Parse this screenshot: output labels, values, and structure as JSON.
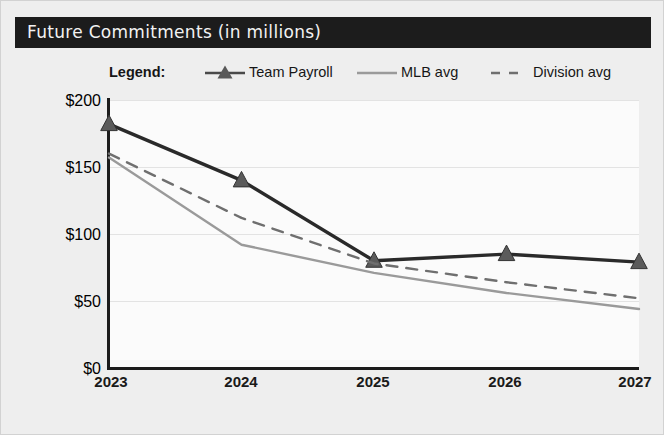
{
  "card": {
    "title": "Future Commitments (in millions)"
  },
  "legend": {
    "label": "Legend:",
    "entries": [
      {
        "name": "Team Payroll",
        "style": "line-marker",
        "color": "#2a2a2a"
      },
      {
        "name": "MLB avg",
        "style": "line-solid",
        "color": "#9a9a9a"
      },
      {
        "name": "Division avg",
        "style": "line-dashed",
        "color": "#6f6f6f"
      }
    ]
  },
  "chart_data": {
    "type": "line",
    "title": "Future Commitments (in millions)",
    "xlabel": "",
    "ylabel": "",
    "categories": [
      "2023",
      "2024",
      "2025",
      "2026",
      "2027"
    ],
    "x": [
      2023,
      2024,
      2025,
      2026,
      2027
    ],
    "ylim": [
      0,
      200
    ],
    "yticks": [
      0,
      50,
      100,
      150,
      200
    ],
    "ytick_labels": [
      "$0",
      "$50",
      "$100",
      "$150",
      "$200"
    ],
    "grid": true,
    "legend_position": "top",
    "series": [
      {
        "name": "Team Payroll",
        "color": "#2a2a2a",
        "marker": "triangle",
        "linestyle": "solid",
        "values": [
          182,
          140,
          80,
          85,
          79
        ]
      },
      {
        "name": "MLB avg",
        "color": "#9a9a9a",
        "marker": "none",
        "linestyle": "solid",
        "values": [
          157,
          92,
          71,
          56,
          44
        ]
      },
      {
        "name": "Division avg",
        "color": "#6f6f6f",
        "marker": "none",
        "linestyle": "dashed",
        "values": [
          160,
          112,
          78,
          64,
          52
        ]
      }
    ]
  },
  "axis": {
    "y_labels": [
      "$200",
      "$150",
      "$100",
      "$50",
      "$0"
    ],
    "x_labels": [
      "2023",
      "2024",
      "2025",
      "2026",
      "2027"
    ]
  }
}
